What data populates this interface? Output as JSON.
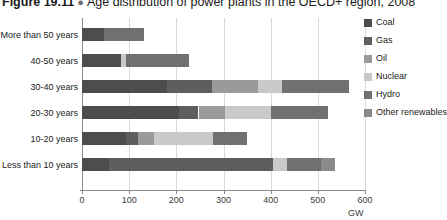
{
  "figure": {
    "number": "Figure 19.11",
    "bullet": "●",
    "title": "Age distribution of power plants in the OECD+ region, 2008"
  },
  "legend": {
    "position": "right",
    "items": [
      {
        "label": "Coal",
        "color": "#4d4d4d"
      },
      {
        "label": "Gas",
        "color": "#5e5e5e"
      },
      {
        "label": "Oil",
        "color": "#9a9a9a"
      },
      {
        "label": "Nuclear",
        "color": "#c9c9c9"
      },
      {
        "label": "Hydro",
        "color": "#707070"
      },
      {
        "label": "Other renewables",
        "color": "#8a8a8a"
      }
    ]
  },
  "axes": {
    "x_unit": "GW",
    "x_ticks": [
      "0",
      "100",
      "200",
      "300",
      "400",
      "500",
      "600"
    ],
    "y_categories": [
      "More than 50 years",
      "40-50 years",
      "30-40 years",
      "20-30 years",
      "10-20 years",
      "Less than 10 years"
    ]
  },
  "chart_data": {
    "type": "bar",
    "orientation": "horizontal",
    "stacked": true,
    "title": "Age distribution of power plants in the OECD+ region, 2008",
    "xlabel": "GW",
    "ylabel": "",
    "xlim": [
      0,
      600
    ],
    "xticks": [
      0,
      100,
      200,
      300,
      400,
      500,
      600
    ],
    "grid": "vertical",
    "legend_position": "right",
    "categories": [
      "More than 50 years",
      "40-50 years",
      "30-40 years",
      "20-30 years",
      "10-20 years",
      "Less than 10 years"
    ],
    "series": [
      {
        "name": "Coal",
        "color": "#4d4d4d",
        "values": [
          47,
          82,
          180,
          206,
          94,
          57
        ]
      },
      {
        "name": "Gas",
        "color": "#5e5e5e",
        "values": [
          0,
          0,
          96,
          41,
          24,
          347
        ]
      },
      {
        "name": "Oil",
        "color": "#9a9a9a",
        "values": [
          0,
          0,
          98,
          57,
          35,
          0
        ]
      },
      {
        "name": "Nuclear",
        "color": "#c9c9c9",
        "values": [
          0,
          12,
          50,
          96,
          125,
          30
        ]
      },
      {
        "name": "Hydro",
        "color": "#707070",
        "values": [
          85,
          133,
          143,
          122,
          71,
          72
        ]
      },
      {
        "name": "Other renewables",
        "color": "#8a8a8a",
        "values": [
          0,
          0,
          0,
          0,
          0,
          30
        ]
      }
    ],
    "totals": [
      132,
      227,
      567,
      522,
      349,
      536
    ]
  },
  "render": {
    "x_origin_px": 82,
    "px_per_gw": 0.4717,
    "row_y_px": [
      12,
      38,
      64,
      90,
      116,
      142
    ],
    "bar_height_px": 13
  }
}
